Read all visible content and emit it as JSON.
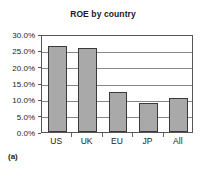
{
  "caption": "(a)",
  "colors": {
    "bar_fill": "#a9a9a9",
    "bar_border": "#3a3a3a",
    "grid": "#888888",
    "axis": "#555555",
    "text": "#1a1a1a",
    "background": "#ffffff"
  },
  "chart_data": {
    "type": "bar",
    "title": "ROE by country",
    "xlabel": "",
    "ylabel": "",
    "categories": [
      "US",
      "UK",
      "EU",
      "JP",
      "All"
    ],
    "values": [
      26.2,
      25.7,
      12.4,
      8.9,
      10.3
    ],
    "value_labels": [
      "26.2%",
      "25.7%",
      "12.4%",
      "8.9%",
      "10.3%"
    ],
    "ylim": [
      0,
      30
    ],
    "yticks": [
      0,
      5,
      10,
      15,
      20,
      25,
      30
    ],
    "ytick_labels": [
      "0.0%",
      "5.0%",
      "10.0%",
      "15.0%",
      "20.0%",
      "25.0%",
      "30.0%"
    ],
    "grid": true,
    "grid_axis": "y",
    "legend": false,
    "legend_position": "none",
    "series": [
      {
        "name": "ROE",
        "values": [
          26.2,
          25.7,
          12.4,
          8.9,
          10.3
        ]
      }
    ]
  }
}
